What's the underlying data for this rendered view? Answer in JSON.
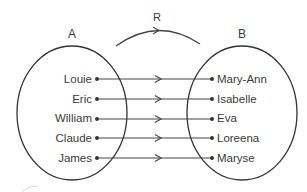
{
  "diagram": {
    "type": "relation-mapping",
    "relation": {
      "label": "R"
    },
    "set_a": {
      "label": "A",
      "elements": [
        "Louie",
        "Eric",
        "William",
        "Claude",
        "James"
      ]
    },
    "set_b": {
      "label": "B",
      "elements": [
        "Mary-Ann",
        "Isabelle",
        "Eva",
        "Loreena",
        "Maryse"
      ]
    },
    "mappings": [
      {
        "from": "Louie",
        "to": "Mary-Ann"
      },
      {
        "from": "Eric",
        "to": "Isabelle"
      },
      {
        "from": "William",
        "to": "Eva"
      },
      {
        "from": "Claude",
        "to": "Loreena"
      },
      {
        "from": "James",
        "to": "Maryse"
      }
    ],
    "colors": {
      "stroke": "#333333",
      "text": "#3a3a3a",
      "background": "#ffffff"
    }
  }
}
